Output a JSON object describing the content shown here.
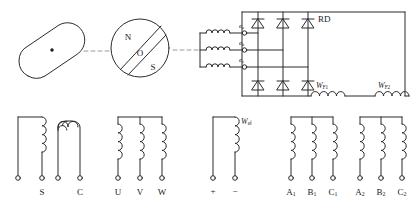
{
  "diagram": {
    "stroke_color": "#2b2b2b",
    "dash_color": "#9a9a9a",
    "background": "#ffffff"
  },
  "rotor_pole": {
    "name": "salient-pole-rotor",
    "center_dot": "·"
  },
  "rotor_circle": {
    "pole_north": "N",
    "center": "O",
    "pole_south": "S"
  },
  "exciter": {
    "phase_labels": [
      {
        "base": "e",
        "sub": "a"
      },
      {
        "base": "e",
        "sub": "b"
      },
      {
        "base": "e",
        "sub": "c"
      }
    ]
  },
  "rectifier": {
    "label": "RD",
    "top_diode_count": 3,
    "bottom_diode_count": 3
  },
  "field_windings": [
    {
      "base": "W",
      "sub": "F1"
    },
    {
      "base": "W",
      "sub": "F2"
    }
  ],
  "terminal_groups": [
    {
      "name": "sc-group",
      "terminals": [
        {
          "label": ""
        },
        {
          "label": "S"
        },
        {
          "label": ""
        },
        {
          "label": "C"
        }
      ]
    },
    {
      "name": "uvw-group",
      "terminals": [
        {
          "label": "U"
        },
        {
          "label": "V"
        },
        {
          "label": "W"
        }
      ]
    },
    {
      "name": "wef-group",
      "coil_label": {
        "base": "W",
        "sub": "ef"
      },
      "terminals": [
        {
          "label": "+"
        },
        {
          "label": "−"
        }
      ]
    },
    {
      "name": "abc1-group",
      "terminals": [
        {
          "base": "A",
          "sub": "1"
        },
        {
          "base": "B",
          "sub": "1"
        },
        {
          "base": "C",
          "sub": "1"
        }
      ]
    },
    {
      "name": "abc2-group",
      "terminals": [
        {
          "base": "A",
          "sub": "2"
        },
        {
          "base": "B",
          "sub": "2"
        },
        {
          "base": "C",
          "sub": "2"
        }
      ]
    }
  ]
}
